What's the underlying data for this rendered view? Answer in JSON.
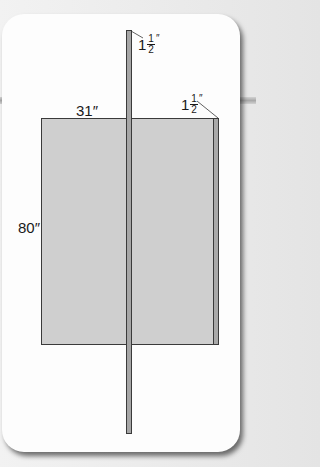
{
  "diagram": {
    "type": "dimension-drawing",
    "colors": {
      "background": "#e8e8e8",
      "card": "#fdfdfd",
      "panel_fill": "#cfcfcf",
      "strip_fill": "#a6a6a6",
      "outline": "#3a3a3a"
    },
    "labels": {
      "width": "31″",
      "height": "80″",
      "top_strip": {
        "whole": "1",
        "numerator": "1",
        "denominator": "2",
        "unit": "″"
      },
      "side_strip": {
        "whole": "1",
        "numerator": "1",
        "denominator": "2",
        "unit": "″"
      }
    },
    "shapes": {
      "panel": {
        "name": "door-panel",
        "width_in": 31,
        "height_in": 80
      },
      "vertical_strip": {
        "name": "long-vertical-strip",
        "thickness_in": 1.5
      },
      "side_strip": {
        "name": "right-edge-strip",
        "thickness_in": 1.5
      }
    }
  }
}
